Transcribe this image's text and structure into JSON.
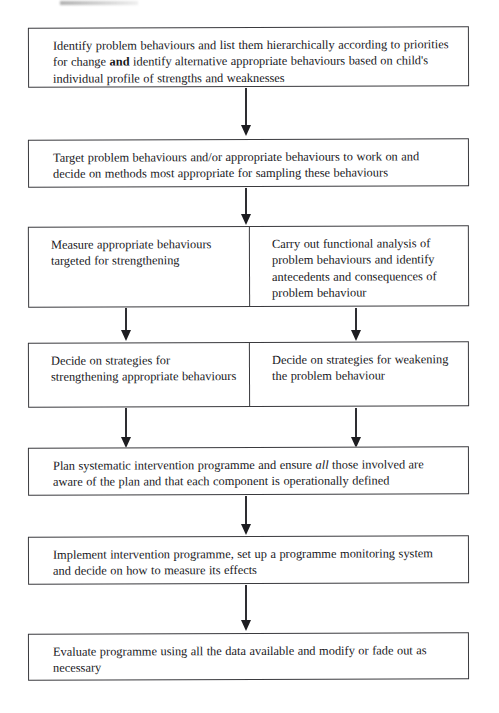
{
  "diagram": {
    "type": "flowchart",
    "orientation": "top-to-bottom",
    "background_color": "#ffffff",
    "box_border_color": "#3a3a3e",
    "text_color": "#16161a",
    "arrow_color": "#1d1d21",
    "nodes": [
      {
        "id": "node-1",
        "layout": "full-width",
        "text_parts": [
          {
            "text": "Identify problem behaviours and list them hierarchically according to priorities for change ",
            "style": "normal"
          },
          {
            "text": "and",
            "style": "bold"
          },
          {
            "text": " identify alternative appropriate behaviours based on child's individual profile of strengths and weaknesses",
            "style": "normal"
          }
        ],
        "plain_text": "Identify problem behaviours and list them hierarchically according to priorities for change and identify alternative appropriate behaviours based on child's individual profile of strengths and weaknesses"
      },
      {
        "id": "node-2",
        "layout": "full-width",
        "text_parts": [
          {
            "text": "Target problem behaviours and/or appropriate behaviours to work on and decide on methods most appropriate for sampling these behaviours",
            "style": "normal"
          }
        ],
        "plain_text": "Target problem behaviours and/or appropriate behaviours to work on and decide on methods most appropriate for sampling these behaviours"
      },
      {
        "id": "node-3",
        "layout": "split",
        "left": {
          "id": "node-3-left",
          "text_parts": [
            {
              "text": "Measure appropriate behaviours targeted for strengthening",
              "style": "normal"
            }
          ],
          "plain_text": "Measure appropriate behaviours targeted for strengthening"
        },
        "right": {
          "id": "node-3-right",
          "text_parts": [
            {
              "text": "Carry out functional analysis of problem behaviours and identify antecedents and consequences of problem behaviour",
              "style": "normal"
            }
          ],
          "plain_text": "Carry out functional analysis of problem behaviours and identify antecedents and consequences of problem behaviour"
        }
      },
      {
        "id": "node-4",
        "layout": "split",
        "left": {
          "id": "node-4-left",
          "text_parts": [
            {
              "text": "Decide on strategies for strengthening appropriate behaviours",
              "style": "normal"
            }
          ],
          "plain_text": "Decide on strategies for strengthening appropriate behaviours"
        },
        "right": {
          "id": "node-4-right",
          "text_parts": [
            {
              "text": "Decide on strategies for weakening the problem behaviour",
              "style": "normal"
            }
          ],
          "plain_text": "Decide on strategies for weakening the problem behaviour"
        }
      },
      {
        "id": "node-5",
        "layout": "full-width",
        "text_parts": [
          {
            "text": "Plan systematic intervention programme and ensure ",
            "style": "normal"
          },
          {
            "text": "all",
            "style": "italic"
          },
          {
            "text": " those involved are aware of the plan and that each component is operationally defined",
            "style": "normal"
          }
        ],
        "plain_text": "Plan systematic intervention programme and ensure all those involved are aware of the plan and that each component is operationally defined"
      },
      {
        "id": "node-6",
        "layout": "full-width",
        "text_parts": [
          {
            "text": "Implement intervention programme, set up a programme monitoring system and decide on how to measure its effects",
            "style": "normal"
          }
        ],
        "plain_text": "Implement intervention programme, set up a programme monitoring system and decide on how to measure its effects"
      },
      {
        "id": "node-7",
        "layout": "full-width",
        "text_parts": [
          {
            "text": "Evaluate programme using all the data available and modify or fade out as necessary",
            "style": "normal"
          }
        ],
        "plain_text": "Evaluate programme using all the data available and modify or fade out as necessary"
      }
    ],
    "connectors": [
      {
        "id": "arrow-1",
        "from": "node-1",
        "to": "node-2",
        "shape": "vertical-arrow",
        "head": "filled-triangle"
      },
      {
        "id": "arrow-2",
        "from": "node-2",
        "to": "node-3",
        "shape": "vertical-arrow",
        "head": "filled-triangle"
      },
      {
        "id": "arrow-3",
        "from": "node-3-left",
        "to": "node-4-left",
        "shape": "vertical-arrow",
        "head": "filled-triangle"
      },
      {
        "id": "arrow-4",
        "from": "node-3-right",
        "to": "node-4-right",
        "shape": "vertical-arrow",
        "head": "filled-triangle"
      },
      {
        "id": "arrow-5",
        "from": "node-4-left",
        "to": "node-5",
        "shape": "vertical-arrow",
        "head": "filled-triangle"
      },
      {
        "id": "arrow-6",
        "from": "node-4-right",
        "to": "node-5",
        "shape": "vertical-arrow",
        "head": "filled-triangle"
      },
      {
        "id": "arrow-7",
        "from": "node-5",
        "to": "node-6",
        "shape": "vertical-arrow",
        "head": "filled-triangle"
      },
      {
        "id": "arrow-8",
        "from": "node-6",
        "to": "node-7",
        "shape": "vertical-arrow",
        "head": "filled-triangle"
      }
    ]
  }
}
